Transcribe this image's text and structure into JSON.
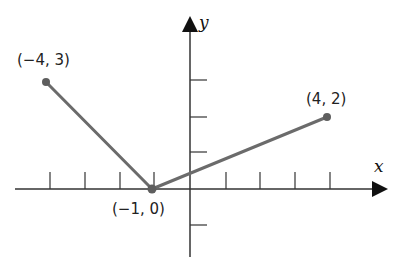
{
  "diagram": {
    "type": "piecewise-linear-graph",
    "axes": {
      "x_label": "x",
      "y_label": "y",
      "x_ticks": [
        -4,
        -3,
        -2,
        -1,
        1,
        2,
        3,
        4
      ],
      "y_ticks": [
        3,
        2,
        1,
        -1
      ]
    },
    "points": [
      {
        "x": -4,
        "y": 3,
        "label": "(−4, 3)"
      },
      {
        "x": -1,
        "y": 0,
        "label": "(−1, 0)"
      },
      {
        "x": 4,
        "y": 2,
        "label": "(4, 2)"
      }
    ],
    "colors": {
      "line": "#6b6b6b",
      "axis": "#333333",
      "point": "#5e5e5e"
    }
  }
}
